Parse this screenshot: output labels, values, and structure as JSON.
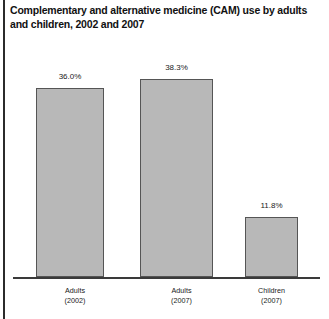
{
  "figure": {
    "width": 329,
    "height": 319,
    "background_color": "#ffffff",
    "rule_color": "#2b2b2b"
  },
  "title": "Complementary and alternative medicine (CAM) use by adults\nand children, 2002 and 2007",
  "axis": {
    "baseline_color": "#3a3a3a"
  },
  "chart_data": {
    "type": "bar",
    "title": "Complementary and alternative medicine (CAM) use by adults and children, 2002 and 2007",
    "xlabel": "",
    "ylabel": "",
    "ylim": [
      0,
      45
    ],
    "grid": false,
    "legend": false,
    "value_suffix": "%",
    "bar_fill_color": "#b8b8b8",
    "bar_edge_color": "#555555",
    "categories": [
      "Adults\n(2002)",
      "Adults\n(2007)",
      "Children\n(2007)"
    ],
    "values": [
      36.0,
      38.3,
      11.8
    ],
    "value_labels": [
      "36.0%",
      "38.3%",
      "11.8%"
    ]
  },
  "bars": [
    {
      "label": "Adults\n(2002)",
      "value_label": "36.0%",
      "left": 36,
      "top": 88,
      "width": 68,
      "height": 189,
      "label_left": 36,
      "label_top": 286,
      "value_top": 72
    },
    {
      "label": "Adults\n(2007)",
      "value_label": "38.3%",
      "left": 140,
      "top": 79,
      "width": 73,
      "height": 198,
      "label_left": 140,
      "label_top": 286,
      "value_top": 63
    },
    {
      "label": "Children\n(2007)",
      "value_label": "11.8%",
      "left": 245,
      "top": 217,
      "width": 53,
      "height": 60,
      "label_left": 240,
      "label_top": 286,
      "value_top": 201
    }
  ]
}
